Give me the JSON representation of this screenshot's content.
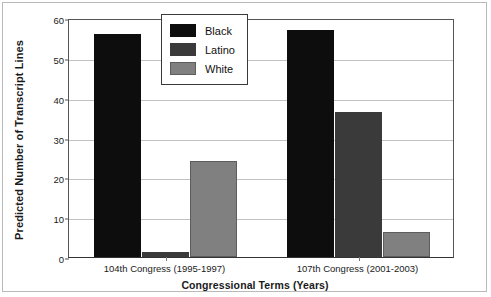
{
  "chart_data": {
    "type": "bar",
    "title": "",
    "xlabel": "Congressional Terms (Years)",
    "ylabel": "Predicted Number of Transcript Lines",
    "categories": [
      "104th Congress (1995-1997)",
      "107th Congress (2001-2003)"
    ],
    "series": [
      {
        "name": "Black",
        "color": "#0d0d0d",
        "values": [
          56.0,
          57.0
        ]
      },
      {
        "name": "Latino",
        "color": "#3a3a3a",
        "values": [
          1.2,
          36.5
        ]
      },
      {
        "name": "White",
        "color": "#808080",
        "values": [
          24.2,
          6.3
        ]
      }
    ],
    "ylim": [
      0,
      60
    ],
    "yticks": [
      0,
      10,
      20,
      30,
      40,
      50,
      60
    ],
    "ytick_labels": [
      "0",
      "10",
      "20",
      "30",
      "40",
      "50",
      "60"
    ],
    "grid": "horizontal",
    "legend_position": "top-center",
    "legend_entries": [
      "Black",
      "Latino",
      "White"
    ]
  }
}
